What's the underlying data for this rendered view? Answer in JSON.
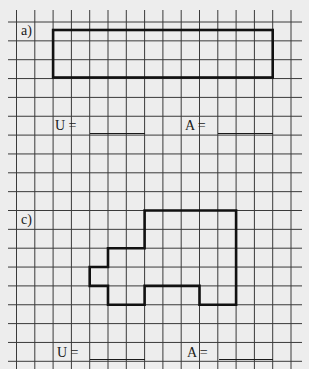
{
  "worksheet": {
    "grid": {
      "cell_width_px": 18.3,
      "cell_height_px": 18.85,
      "columns": 16,
      "rows": 19,
      "line_color": "#3a3a3a",
      "background": "#ededed"
    },
    "exercises": [
      {
        "label": "a)",
        "shape": "rectangle",
        "outline_color": "#111111",
        "perimeter_label": "U =",
        "perimeter_answer": "",
        "area_label": "A =",
        "area_answer": ""
      },
      {
        "label": "c)",
        "shape": "polygon",
        "outline_color": "#111111",
        "perimeter_label": "U =",
        "perimeter_answer": "",
        "area_label": "A =",
        "area_answer": ""
      }
    ]
  }
}
